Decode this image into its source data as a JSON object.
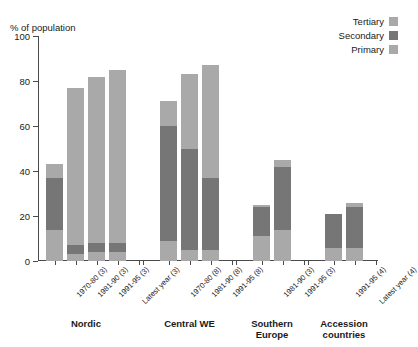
{
  "axis": {
    "ylabel": "% of population",
    "yticks": [
      0,
      20,
      40,
      60,
      80,
      100
    ],
    "ylim": [
      0,
      100
    ]
  },
  "legend": {
    "entries": [
      {
        "label": "Tertiary",
        "color": "#a9a9a9"
      },
      {
        "label": "Secondary",
        "color": "#767676"
      },
      {
        "label": "Primary",
        "color": "#a9a9a9"
      }
    ]
  },
  "groups": [
    {
      "name": "Nordic",
      "label": "Nordic"
    },
    {
      "name": "Central WE",
      "label": "Central WE"
    },
    {
      "name": "Southern Europe",
      "label": "Southern\nEurope"
    },
    {
      "name": "Accession countries",
      "label": "Accession\ncountries"
    }
  ],
  "chart_data": {
    "type": "bar",
    "title": "",
    "xlabel": "",
    "ylabel": "% of population",
    "ylim": [
      0,
      100
    ],
    "yticks": [
      0,
      20,
      40,
      60,
      80,
      100
    ],
    "grid": false,
    "stacked": true,
    "legend_position": "top-right",
    "categories": [
      "1970-80 (3)",
      "1981-90 (3)",
      "1991-95 (3)",
      "Latest year (3)",
      "1970-80 (8)",
      "1981-90 (8)",
      "1991-95 (8)",
      "1981-90 (3)",
      "1991-95 (3)",
      "1991-95 (4)",
      "Latest year (4)"
    ],
    "group_of_category": [
      "Nordic",
      "Nordic",
      "Nordic",
      "Nordic",
      "Central WE",
      "Central WE",
      "Central WE",
      "Southern Europe",
      "Southern Europe",
      "Accession countries",
      "Accession countries"
    ],
    "series": [
      {
        "name": "Primary",
        "color": "#a9a9a9",
        "values": [
          14,
          3,
          4,
          4,
          9,
          5,
          5,
          11,
          14,
          6,
          6
        ]
      },
      {
        "name": "Secondary",
        "color": "#767676",
        "values": [
          23,
          4,
          4,
          4,
          51,
          45,
          32,
          13,
          28,
          15,
          18
        ]
      },
      {
        "name": "Tertiary",
        "color": "#a9a9a9",
        "values": [
          6,
          70,
          74,
          77,
          11,
          33,
          50,
          1,
          3,
          0,
          2
        ]
      }
    ],
    "totals": [
      43,
      77,
      82,
      85,
      71,
      83,
      87,
      25,
      45,
      21,
      26
    ]
  }
}
